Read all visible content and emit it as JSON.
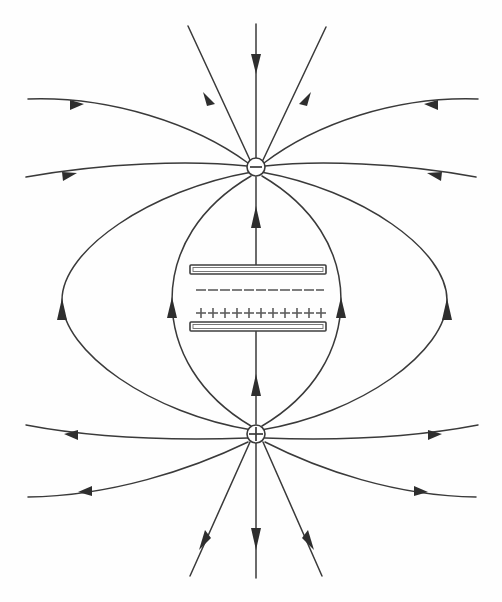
{
  "figure": {
    "background_color": "#fefefe",
    "line_color": "#3a3a3a",
    "arrow_color": "#2e2e2e",
    "width": 502,
    "height": 602
  },
  "charges": {
    "negative": {
      "label": "-",
      "symbol": "minus",
      "cx": 256,
      "cy": 167,
      "r": 9,
      "name": "negative-point-charge"
    },
    "positive": {
      "label": "+",
      "symbol": "plus",
      "cx": 256,
      "cy": 434,
      "r": 9,
      "name": "positive-point-charge"
    }
  },
  "capacitor": {
    "top_plate": {
      "name": "top-plate-negative",
      "x": 190,
      "y": 265,
      "width": 136,
      "height": 9,
      "charge_sign": "-",
      "charge_count": 11
    },
    "bottom_plate": {
      "name": "bottom-plate-positive",
      "x": 190,
      "y": 322,
      "width": 136,
      "height": 9,
      "charge_sign": "+",
      "charge_count": 11
    },
    "minus_row_y": 290,
    "plus_row_y": 313
  },
  "field": {
    "inner_line_direction": "upward",
    "outer_loop_direction": "upward",
    "top_arrows_direction": "inward-down",
    "bottom_arrows_direction": "outward-down",
    "line_count": 14
  }
}
